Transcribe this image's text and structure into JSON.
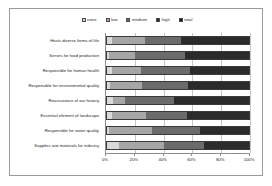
{
  "chart_data": {
    "type": "bar",
    "orientation": "horizontal",
    "stacked": true,
    "title": "",
    "xlabel": "",
    "ylabel": "",
    "xlim": [
      0,
      100
    ],
    "grid": true,
    "legend_position": "top-center",
    "tick_labels": [
      "0%",
      "20%",
      "40%",
      "60%",
      "80%",
      "100%"
    ],
    "tick_values": [
      0,
      20,
      40,
      60,
      80,
      100
    ],
    "categories": [
      "Hosts diverse forms of life",
      "Serves for food production",
      "Responsible for human health",
      "Responsible for environmental quality",
      "Reassurance of our history",
      "Essential element of landscape",
      "Responsible for water quality",
      "Supplies raw materials for industry"
    ],
    "series": [
      {
        "name": "none",
        "color": "#d9d9d9",
        "values": [
          4,
          2,
          4,
          3,
          5,
          4,
          2,
          9
        ]
      },
      {
        "name": "low",
        "color": "#a6a6a6",
        "values": [
          23,
          18,
          20,
          22,
          8,
          24,
          30,
          31
        ]
      },
      {
        "name": "medium",
        "color": "#6b6b6b",
        "values": [
          25,
          35,
          34,
          32,
          34,
          28,
          33,
          28
        ]
      },
      {
        "name": "high",
        "color": "#2b2b2b",
        "values": [
          48,
          45,
          42,
          43,
          53,
          44,
          35,
          32
        ]
      },
      {
        "name": "total",
        "color": "#111111",
        "values": [
          0,
          0,
          0,
          0,
          0,
          0,
          0,
          0
        ]
      }
    ],
    "legend": [
      {
        "label": "none",
        "color": "#d9d9d9"
      },
      {
        "label": "low",
        "color": "#a6a6a6"
      },
      {
        "label": "medium",
        "color": "#6b6b6b"
      },
      {
        "label": "high",
        "color": "#2b2b2b"
      },
      {
        "label": "total",
        "color": "#111111"
      }
    ]
  }
}
